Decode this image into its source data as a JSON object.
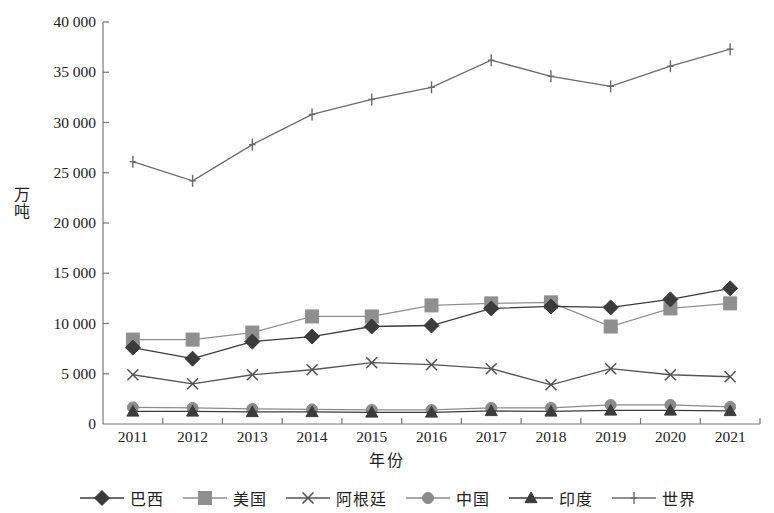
{
  "chart_data": {
    "type": "line",
    "title": "",
    "xlabel": "年份",
    "ylabel": "万吨",
    "categories": [
      "2011",
      "2012",
      "2013",
      "2014",
      "2015",
      "2016",
      "2017",
      "2018",
      "2019",
      "2020",
      "2021"
    ],
    "x": [
      2011,
      2012,
      2013,
      2014,
      2015,
      2016,
      2017,
      2018,
      2019,
      2020,
      2021
    ],
    "ylim": [
      0,
      40000
    ],
    "yticks": [
      0,
      5000,
      10000,
      15000,
      20000,
      25000,
      30000,
      35000,
      40000
    ],
    "ytick_labels": [
      "0",
      "5 000",
      "10 000",
      "15 000",
      "20 000",
      "25 000",
      "30 000",
      "35 000",
      "40 000"
    ],
    "grid": false,
    "legend_position": "bottom",
    "series": [
      {
        "name": "巴西",
        "marker": "diamond",
        "color": "#3b3b3b",
        "values": [
          7600,
          6500,
          8200,
          8700,
          9700,
          9800,
          11500,
          11700,
          11600,
          12400,
          13500
        ]
      },
      {
        "name": "美国",
        "marker": "square",
        "color": "#8f8f8f",
        "values": [
          8400,
          8400,
          9100,
          10700,
          10700,
          11800,
          12000,
          12100,
          9700,
          11500,
          12000
        ]
      },
      {
        "name": "阿根廷",
        "marker": "x",
        "color": "#555555",
        "values": [
          4900,
          4000,
          4900,
          5400,
          6100,
          5900,
          5500,
          3900,
          5500,
          4900,
          4700
        ]
      },
      {
        "name": "中国",
        "marker": "circle",
        "color": "#8a8a8a",
        "values": [
          1650,
          1600,
          1500,
          1450,
          1400,
          1400,
          1600,
          1600,
          1900,
          1900,
          1700
        ]
      },
      {
        "name": "印度",
        "marker": "triangle",
        "color": "#3b3b3b",
        "values": [
          1250,
          1250,
          1200,
          1200,
          1150,
          1150,
          1300,
          1250,
          1350,
          1350,
          1300
        ]
      },
      {
        "name": "世界",
        "marker": "plus",
        "color": "#6a6a6a",
        "values": [
          26100,
          24200,
          27800,
          30800,
          32300,
          33500,
          36200,
          34600,
          33600,
          35600,
          37300
        ]
      }
    ]
  },
  "axes": {
    "ylabel": "万吨",
    "xlabel": "年份"
  }
}
